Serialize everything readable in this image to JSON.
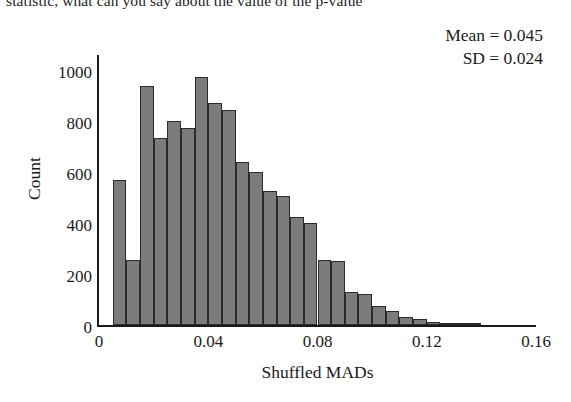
{
  "page_text": "statistic, what can you say about the value of the p-value",
  "chart_data": {
    "type": "bar",
    "title": "",
    "subtitle": "",
    "xlabel": "Shuffled MADs",
    "ylabel": "Count",
    "xlim": [
      0,
      0.16
    ],
    "ylim": [
      0,
      1060
    ],
    "grid": false,
    "legend": false,
    "bin_width": 0.005,
    "xticks": [
      "0",
      "0.04",
      "0.08",
      "0.12",
      "0.16"
    ],
    "xtick_values": [
      0,
      0.04,
      0.08,
      0.12,
      0.16
    ],
    "yticks": [
      "0",
      "200",
      "400",
      "600",
      "800",
      "1000"
    ],
    "ytick_values": [
      0,
      200,
      400,
      600,
      800,
      1000
    ],
    "bar_color": "#7c7c7c",
    "bar_edge_color": "#2b2b2b",
    "categories": [
      "0.000",
      "0.005",
      "0.010",
      "0.015",
      "0.020",
      "0.025",
      "0.030",
      "0.035",
      "0.040",
      "0.045",
      "0.050",
      "0.055",
      "0.060",
      "0.065",
      "0.070",
      "0.075",
      "0.080",
      "0.085",
      "0.090",
      "0.095",
      "0.100",
      "0.105",
      "0.110",
      "0.115",
      "0.120",
      "0.125",
      "0.130",
      "0.135",
      "0.140",
      "0.145"
    ],
    "bin_starts": [
      0.0,
      0.005,
      0.01,
      0.015,
      0.02,
      0.025,
      0.03,
      0.035,
      0.04,
      0.045,
      0.05,
      0.055,
      0.06,
      0.065,
      0.07,
      0.075,
      0.08,
      0.085,
      0.09,
      0.095,
      0.1,
      0.105,
      0.11,
      0.115,
      0.12,
      0.125,
      0.13,
      0.135,
      0.14,
      0.145
    ],
    "values": [
      0,
      570,
      255,
      940,
      735,
      800,
      775,
      975,
      870,
      845,
      640,
      600,
      525,
      505,
      425,
      400,
      255,
      250,
      130,
      120,
      75,
      55,
      30,
      25,
      12,
      8,
      4,
      2,
      0,
      0
    ]
  },
  "annotation": {
    "mean_label": "Mean = 0.045",
    "sd_label": "SD = 0.024"
  }
}
